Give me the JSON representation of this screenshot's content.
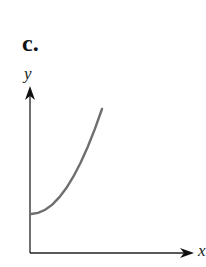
{
  "panel_label": "c.",
  "chart_data": {
    "type": "line",
    "title": "c.",
    "xlabel": "x",
    "ylabel": "y",
    "x": [
      0,
      0.1,
      0.2,
      0.3,
      0.4,
      0.5,
      0.6,
      0.7,
      0.8,
      0.9,
      1.0
    ],
    "values": [
      1.0,
      1.02,
      1.08,
      1.18,
      1.32,
      1.5,
      1.72,
      1.98,
      2.28,
      2.62,
      3.0
    ],
    "ticks": "none",
    "grid": false,
    "legend": "none",
    "colors": {
      "axis": "#222222",
      "curve": "#6e6e6e"
    }
  }
}
